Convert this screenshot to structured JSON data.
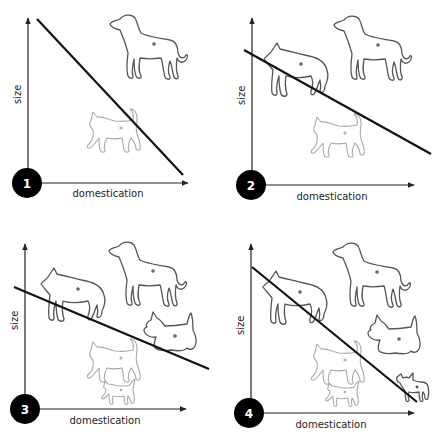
{
  "figure": {
    "type": "four-panel conceptual diagram",
    "panels": [
      {
        "number": "1",
        "x_label": "domestication",
        "y_label": "size",
        "animals": [
          "dog (large, hound)",
          "cat"
        ],
        "trend": "steep negative line"
      },
      {
        "number": "2",
        "x_label": "domestication",
        "y_label": "size",
        "animals": [
          "wolf",
          "dog (large, hound)",
          "cat"
        ],
        "trend": "shallower negative line"
      },
      {
        "number": "3",
        "x_label": "domestication",
        "y_label": "size",
        "animals": [
          "wolf",
          "dog (large, hound)",
          "terrier",
          "cat",
          "kitten"
        ],
        "trend": "shallow negative line"
      },
      {
        "number": "4",
        "x_label": "domestication",
        "y_label": "size",
        "animals": [
          "wolf",
          "dog (large, hound)",
          "terrier",
          "cat",
          "kitten",
          "small dog (chihuahua)"
        ],
        "trend": "steep negative line"
      }
    ]
  }
}
